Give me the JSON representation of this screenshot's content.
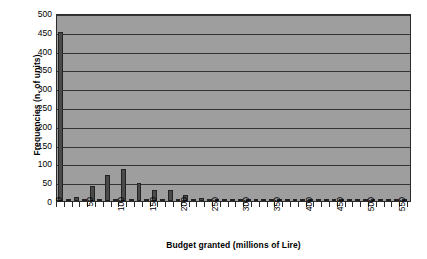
{
  "chart_data": {
    "type": "bar",
    "title": "",
    "subtitle": "",
    "xlabel": "Budget granted (millions of Lire)",
    "ylabel": "Frequencies (n. of units)",
    "ylim": [
      0,
      500
    ],
    "ytick_values": [
      0,
      50,
      100,
      150,
      200,
      250,
      300,
      350,
      400,
      450,
      500
    ],
    "ytick_labels": [
      "0",
      "50",
      "100",
      "150",
      "200",
      "250",
      "300",
      "350",
      "400",
      "450",
      "500"
    ],
    "xlim": [
      -6.25,
      562.5
    ],
    "xtick_values": [
      0,
      50,
      100,
      150,
      200,
      250,
      300,
      350,
      400,
      450,
      500,
      550
    ],
    "xtick_labels": [
      "0",
      "50",
      "100",
      "150",
      "200",
      "250",
      "300",
      "350",
      "400",
      "450",
      "500",
      "550"
    ],
    "grid": "horizontal",
    "legend": "none",
    "bin_width": 12.5,
    "x": [
      0,
      12.5,
      25,
      37.5,
      50,
      62.5,
      75,
      87.5,
      100,
      112.5,
      125,
      137.5,
      150,
      162.5,
      175,
      187.5,
      200,
      212.5,
      225,
      237.5,
      250,
      262.5,
      275,
      287.5,
      300,
      312.5,
      325,
      337.5,
      350,
      362.5,
      375,
      387.5,
      400,
      412.5,
      425,
      437.5,
      450,
      462.5,
      475,
      487.5,
      500,
      512.5,
      525,
      537.5,
      550
    ],
    "values": [
      450,
      4,
      10,
      4,
      40,
      5,
      70,
      6,
      85,
      5,
      48,
      4,
      30,
      4,
      28,
      4,
      17,
      3,
      8,
      3,
      5,
      3,
      4,
      3,
      3,
      2,
      3,
      2,
      2,
      2,
      2,
      2,
      2,
      2,
      2,
      2,
      2,
      2,
      2,
      2,
      2,
      2,
      1,
      1,
      1
    ],
    "colors": {
      "bar_fill": "#4a4a4a",
      "bar_edge": "#232323",
      "plot_background": "#9e9e9e",
      "gridline": "#343434",
      "axis": "#2b2b2b",
      "text": "#000000",
      "figure_background": "#ffffff"
    }
  }
}
